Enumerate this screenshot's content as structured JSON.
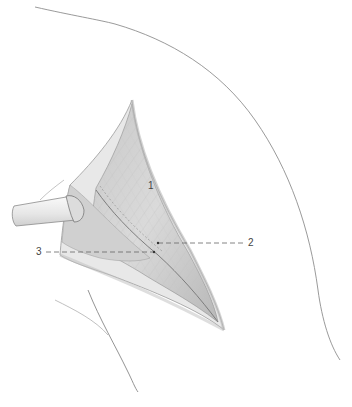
{
  "figure": {
    "type": "surgical-anatomical-illustration",
    "colors": {
      "background": "#ffffff",
      "outline": "#9a9a9a",
      "muscle_light": "#d4d4d4",
      "muscle_dark": "#a8a8a8",
      "retractor": "#eeeeee",
      "leader_line": "#666666",
      "label_text": "#444444"
    },
    "labels": [
      {
        "id": "1",
        "text": "1"
      },
      {
        "id": "2",
        "text": "2"
      },
      {
        "id": "3",
        "text": "3"
      }
    ]
  }
}
